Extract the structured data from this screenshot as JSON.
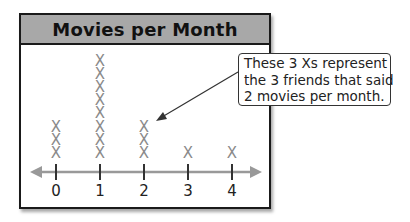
{
  "title": "Movies per Month",
  "callout": {
    "lines": [
      "These 3 Xs represent",
      "the 3 friends that said",
      "2 movies per month."
    ]
  },
  "colors": {
    "header_bg": "#a8a8a8",
    "x_mark": "#8a8a8a",
    "axis": "#999999",
    "frame": "#1a1a1a"
  },
  "chart_data": {
    "type": "line_plot",
    "title": "Movies per Month",
    "xlabel": "",
    "ylabel": "",
    "categories": [
      "0",
      "1",
      "2",
      "3",
      "4"
    ],
    "values": [
      3,
      8,
      3,
      1,
      1
    ],
    "marker": "X",
    "annotation": "These 3 Xs represent the 3 friends that said 2 movies per month.",
    "annotation_points_to": "2",
    "grid": false,
    "legend": null
  }
}
